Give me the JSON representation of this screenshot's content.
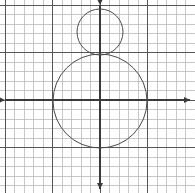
{
  "figure": {
    "background_color": "#ffffff",
    "width": 195,
    "height": 193
  },
  "grid": {
    "minor_color": "#b9b9b9",
    "major_color": "#565656",
    "minor_step_px": 9.5,
    "major_every": 5,
    "origin_px": {
      "x": 100,
      "y": 100
    },
    "x_start_px": 5.5,
    "y_start_px": 5.5
  },
  "axes": {
    "color": "#3a3a3a",
    "x_axis": {
      "name": "x-axis",
      "y_px": 100,
      "from_px": 5,
      "to_px": 190,
      "arrow_left": true,
      "arrow_right": true
    },
    "y_axis": {
      "name": "y-axis",
      "x_px": 100,
      "from_px": 5,
      "to_px": 189,
      "arrow_up": true,
      "arrow_down": true
    }
  },
  "chart_data": {
    "type": "scatter",
    "xlabel": "x",
    "ylabel": "y",
    "grid": true,
    "legend": false,
    "xlim": [
      -10,
      9
    ],
    "ylim": [
      -9,
      10
    ],
    "units_per_cell": 1,
    "shapes": [
      {
        "name": "small-circle",
        "type": "circle",
        "center": {
          "x": 0,
          "y": 4.75
        },
        "center_px": {
          "x": 100,
          "y": 32
        },
        "radius": 2.4,
        "radius_px": 23,
        "stroke": "#4a4a4a",
        "stroke_width": 1,
        "fill": "none"
      },
      {
        "name": "large-circle",
        "type": "circle",
        "center": {
          "x": 0,
          "y": -0.1
        },
        "center_px": {
          "x": 100,
          "y": 101
        },
        "radius": 4.95,
        "radius_px": 47,
        "stroke": "#4a4a4a",
        "stroke_width": 1,
        "fill": "none"
      }
    ],
    "annotations": [
      {
        "name": "tangency-point",
        "x": 0,
        "y": 2.35,
        "x_px": 100,
        "y_px": 55,
        "label": "circles tangent"
      }
    ]
  }
}
